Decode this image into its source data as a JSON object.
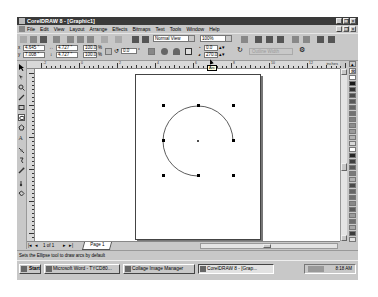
{
  "window": {
    "title": "CorelDRAW 8 - [Graphic1]",
    "controls": [
      "minimize",
      "restore",
      "close"
    ]
  },
  "menubar": {
    "items": [
      "File",
      "Edit",
      "View",
      "Layout",
      "Arrange",
      "Effects",
      "Bitmaps",
      "Text",
      "Tools",
      "Window",
      "Help"
    ]
  },
  "standard_toolbar": {
    "view_mode": "Normal View",
    "zoom_level": "100%"
  },
  "property_bar": {
    "x_pos": "4.645 \"",
    "y_pos": "7.008 \"",
    "width": "4.727 \"",
    "height": "4.727 \"",
    "scale_x": "100.0",
    "scale_y": "100.0",
    "scale_unit": "%",
    "rotation": "0.0",
    "start_angle": "0.0",
    "end_angle": "270.0",
    "outline_label": "Outline Width",
    "tooltip": "Arc"
  },
  "ruler": {
    "unit": "inches",
    "labels": [
      "-2",
      "0",
      "2",
      "4",
      "6",
      "8",
      "10",
      "12"
    ]
  },
  "toolbox": {
    "tools": [
      "pick-tool",
      "shape-tool",
      "zoom-tool",
      "freehand-tool",
      "rectangle-tool",
      "ellipse-tool",
      "polygon-tool",
      "text-tool",
      "interactive-fill-tool",
      "interactive-transparency-tool",
      "eyedropper-tool",
      "outline-tool",
      "fill-tool"
    ],
    "active": "ellipse-tool"
  },
  "palette": {
    "colors": [
      "#ffffff",
      "#1a1a1a",
      "#333333",
      "#4d4d4d",
      "#595959",
      "#666666",
      "#737373",
      "#808080",
      "#8c8c8c",
      "#999999",
      "#b3b3b3",
      "#d9d9d9",
      "#ffffff",
      "#262626",
      "#404040",
      "#5a5a5a",
      "#7a7a7a",
      "#b0b0b0",
      "#4a4a4a",
      "#666666",
      "#707070",
      "#888888",
      "#5c5c5c",
      "#9a9a9a",
      "#6e6e6e",
      "#a8a8a8",
      "#3c3c3c",
      "#e0e0e0"
    ]
  },
  "navigator": {
    "page_count": "1 of 1",
    "page_tab": "Page 1"
  },
  "status_bar": {
    "message": "Sets the Ellipse tool to draw arcs by default"
  },
  "taskbar": {
    "start_label": "Start",
    "buttons": [
      {
        "label": "Microsoft Word - TYCD80...",
        "active": false
      },
      {
        "label": "Collage Image Manager",
        "active": false
      },
      {
        "label": "CorelDRAW 8 - [Grap...",
        "active": true
      }
    ],
    "clock": "8:18 AM"
  }
}
